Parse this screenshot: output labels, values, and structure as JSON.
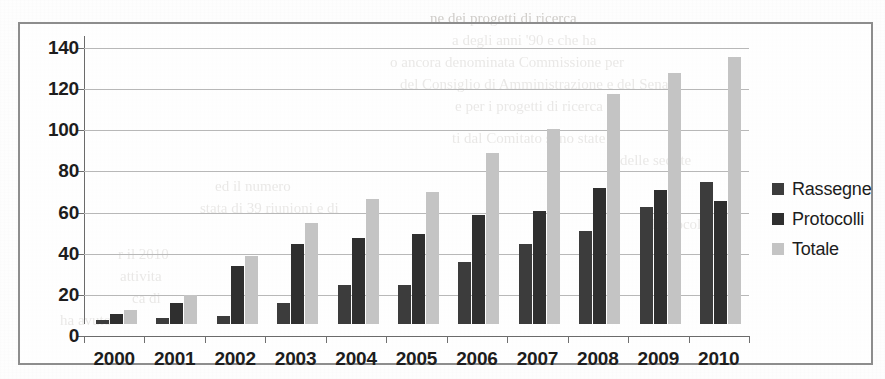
{
  "document": {
    "kind": "scanned-page-figure",
    "bleed_through_lines": [
      {
        "text": "ne dei progetti di ricerca",
        "x": 430,
        "y": 8
      },
      {
        "text": "a degli anni '90 e che ha",
        "x": 452,
        "y": 30
      },
      {
        "text": "o ancora denominata Commissione per",
        "x": 390,
        "y": 52
      },
      {
        "text": "del Consiglio di Amministrazione e del Senato",
        "x": 400,
        "y": 74
      },
      {
        "text": "e per i progetti di ricerca",
        "x": 455,
        "y": 96
      },
      {
        "text": "ti dal Comitato sono state",
        "x": 452,
        "y": 128
      },
      {
        "text": "delle sedute",
        "x": 620,
        "y": 150
      },
      {
        "text": "ed il numero",
        "x": 215,
        "y": 176
      },
      {
        "text": "stata di 39 riunioni e di",
        "x": 200,
        "y": 198
      },
      {
        "text": "e Protocolli",
        "x": 640,
        "y": 214
      },
      {
        "text": "r il 2010",
        "x": 118,
        "y": 244
      },
      {
        "text": "attivita",
        "x": 120,
        "y": 266
      },
      {
        "text": "ca di",
        "x": 132,
        "y": 288
      },
      {
        "text": "ha avuto",
        "x": 60,
        "y": 310
      }
    ]
  },
  "chart_data": {
    "type": "bar",
    "title": "",
    "subtitle": "",
    "xlabel": "",
    "ylabel": "",
    "categories": [
      "2000",
      "2001",
      "2002",
      "2003",
      "2004",
      "2005",
      "2006",
      "2007",
      "2008",
      "2009",
      "2010"
    ],
    "series": [
      {
        "name": "Rassegne",
        "color": "#3c3c3c",
        "values": [
          2,
          3,
          4,
          10,
          19,
          19,
          30,
          39,
          45,
          57,
          69
        ]
      },
      {
        "name": "Protocolli",
        "color": "#2f2f2f",
        "values": [
          5,
          10,
          28,
          39,
          42,
          44,
          53,
          55,
          66,
          65,
          60
        ]
      },
      {
        "name": "Totale",
        "color": "#c4c4c4",
        "values": [
          7,
          14,
          33,
          49,
          61,
          64,
          83,
          95,
          112,
          122,
          130
        ]
      }
    ],
    "ylim": [
      0,
      140
    ],
    "y_ticks": [
      0,
      20,
      40,
      60,
      80,
      100,
      120,
      140
    ],
    "grid": true,
    "legend_position": "right",
    "legend_entries": [
      "Rassegne",
      "Protocolli",
      "Totale"
    ],
    "frame_border_color": "#8d8d8d",
    "gridline_color": "#b8b8b8",
    "axis_color": "#6b6b6b",
    "plot_background": "#ffffff"
  }
}
